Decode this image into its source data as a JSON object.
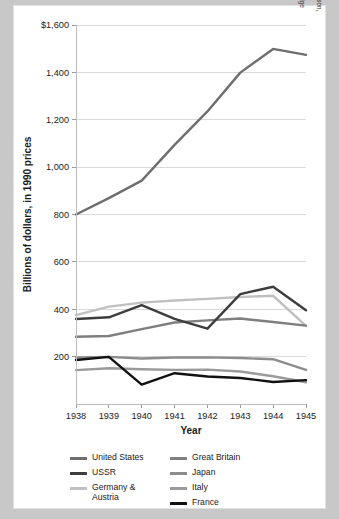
{
  "chart_data": {
    "type": "line",
    "title": "",
    "xlabel": "Year",
    "ylabel": "Billions of dollars, in 1990 prices",
    "x": [
      1938,
      1939,
      1940,
      1941,
      1942,
      1943,
      1944,
      1945
    ],
    "xtick_labels": [
      "1938",
      "1939",
      "1940",
      "1941",
      "1942",
      "1943",
      "1944",
      "1945"
    ],
    "ytick_labels": [
      "$1,600",
      "1,400",
      "1,200",
      "1,000",
      "800",
      "600",
      "400",
      "200"
    ],
    "ytick_values": [
      1600,
      1400,
      1200,
      1000,
      800,
      600,
      400,
      200
    ],
    "ylim": [
      0,
      1600
    ],
    "grid": true,
    "legend_position": "bottom",
    "series": [
      {
        "name": "United States",
        "color": "#6e6e6e",
        "values": [
          800,
          869,
          943,
          1094,
          1235,
          1399,
          1499,
          1474
        ]
      },
      {
        "name": "USSR",
        "color": "#3d3d3d",
        "values": [
          359,
          366,
          417,
          359,
          318,
          464,
          495,
          396
        ]
      },
      {
        "name": "Germany & Austria",
        "color": "#c0c0c0",
        "values": [
          375,
          411,
          428,
          437,
          444,
          452,
          457,
          330
        ]
      },
      {
        "name": "Great Britain",
        "color": "#7f7f7f",
        "values": [
          284,
          287,
          316,
          344,
          353,
          361,
          346,
          331
        ]
      },
      {
        "name": "Japan",
        "color": "#8c8c8c",
        "values": [
          196,
          199,
          192,
          196,
          197,
          194,
          189,
          144
        ]
      },
      {
        "name": "Italy",
        "color": "#9a9a9a",
        "values": [
          143,
          151,
          147,
          144,
          145,
          137,
          117,
          92
        ]
      },
      {
        "name": "France",
        "color": "#111111",
        "values": [
          186,
          199,
          82,
          130,
          116,
          110,
          93,
          101
        ]
      }
    ]
  },
  "axes": {
    "y_title": "Billions of dollars, in 1990 prices",
    "x_title": "Year"
  },
  "legend": {
    "left_column": [
      {
        "label": "United States",
        "color": "#6e6e6e"
      },
      {
        "label": "USSR",
        "color": "#3d3d3d"
      },
      {
        "label": "Germany &",
        "label_cont": "Austria",
        "color": "#c0c0c0"
      }
    ],
    "right_column": [
      {
        "label": "Great Britain",
        "color": "#7f7f7f"
      },
      {
        "label": "Japan",
        "color": "#8c8c8c"
      },
      {
        "label": "Italy",
        "color": "#9a9a9a"
      },
      {
        "label": "France",
        "color": "#111111"
      }
    ]
  },
  "credit": {
    "line1": "Hewitt/Lawson, Exploring American Histories, 4e, © 2022 Bedford/St. Martin's. Data from Mark Harrison, ed.,",
    "line2": "The Economics of World War II: Six Great Powers in International Comparison (Cambridge: Cambridge",
    "line3": "University Press 1998), 11."
  }
}
